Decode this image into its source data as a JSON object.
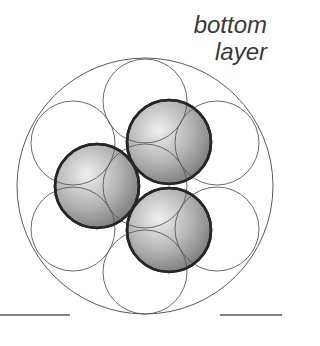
{
  "label": {
    "line1": "bottom",
    "line2": "layer"
  },
  "colors": {
    "outline": "#5a5a5a",
    "sphere_border": "#262626",
    "sphere_light": "#ececec",
    "sphere_dark": "#7e7e7e",
    "baseline": "#5a5a5a",
    "text": "#3a3a3a"
  },
  "container_circle": {
    "cx": 145,
    "cy": 186,
    "r": 128
  },
  "outline_circles": [
    {
      "name": "top",
      "cx": 145,
      "cy": 101,
      "r": 42
    },
    {
      "name": "upper-right",
      "cx": 217,
      "cy": 143,
      "r": 42
    },
    {
      "name": "lower-right",
      "cx": 217,
      "cy": 229,
      "r": 42
    },
    {
      "name": "bottom",
      "cx": 145,
      "cy": 272,
      "r": 42
    },
    {
      "name": "lower-left",
      "cx": 73,
      "cy": 229,
      "r": 42
    },
    {
      "name": "upper-left",
      "cx": 73,
      "cy": 143,
      "r": 42
    },
    {
      "name": "center",
      "cx": 145,
      "cy": 186,
      "r": 42
    }
  ],
  "spheres": [
    {
      "name": "upper",
      "cx": 169,
      "cy": 142,
      "r": 42
    },
    {
      "name": "left",
      "cx": 97,
      "cy": 186,
      "r": 42
    },
    {
      "name": "lower",
      "cx": 169,
      "cy": 230,
      "r": 42
    }
  ],
  "baselines": [
    {
      "x1": 0,
      "x2": 70,
      "y": 315
    },
    {
      "x1": 220,
      "x2": 282,
      "y": 315
    }
  ]
}
